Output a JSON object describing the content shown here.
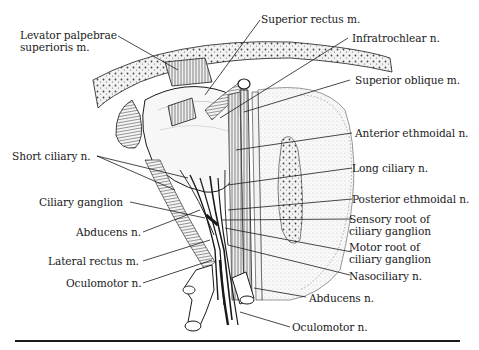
{
  "figure": {
    "labels_left": [
      {
        "id": "levator",
        "lines": [
          "Levator palpebrae",
          "superioris m."
        ]
      },
      {
        "id": "short-ciliary",
        "lines": [
          "Short ciliary n."
        ]
      },
      {
        "id": "ciliary-ganglion",
        "lines": [
          "Ciliary ganglion"
        ]
      },
      {
        "id": "abducens-left",
        "lines": [
          "Abducens n."
        ]
      },
      {
        "id": "lateral-rectus",
        "lines": [
          "Lateral rectus m."
        ]
      },
      {
        "id": "oculomotor-left",
        "lines": [
          "Oculomotor n."
        ]
      }
    ],
    "labels_right": [
      {
        "id": "superior-rectus",
        "lines": [
          "Superior rectus m."
        ]
      },
      {
        "id": "infratrochlear",
        "lines": [
          "Infratrochlear n."
        ]
      },
      {
        "id": "superior-oblique",
        "lines": [
          "Superior oblique m."
        ]
      },
      {
        "id": "anterior-ethmoidal",
        "lines": [
          "Anterior ethmoidal n."
        ]
      },
      {
        "id": "long-ciliary",
        "lines": [
          "Long ciliary n."
        ]
      },
      {
        "id": "posterior-ethmoidal",
        "lines": [
          "Posterior ethmoidal n."
        ]
      },
      {
        "id": "sensory-root",
        "lines": [
          "Sensory root of",
          "ciliary ganglion"
        ]
      },
      {
        "id": "motor-root",
        "lines": [
          "Motor root of",
          "ciliary ganglion"
        ]
      },
      {
        "id": "nasociliary",
        "lines": [
          "Nasociliary n."
        ]
      }
    ],
    "labels_bottom": [
      {
        "id": "abducens-bottom",
        "lines": [
          "Abducens n."
        ]
      },
      {
        "id": "oculomotor-bottom",
        "lines": [
          "Oculomotor n."
        ]
      }
    ],
    "colors": {
      "ink": "#1a1a1a",
      "background": "#ffffff",
      "bone": "#d9d9d9"
    }
  }
}
